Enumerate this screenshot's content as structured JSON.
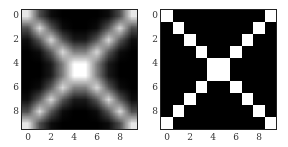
{
  "chart_data": [
    {
      "type": "heatmap",
      "title": "",
      "description": "Blurred (smoothed) X-shaped pattern on 10x10 grid",
      "xticks": [
        "0",
        "2",
        "4",
        "6",
        "8"
      ],
      "yticks": [
        "0",
        "2",
        "4",
        "6",
        "8"
      ],
      "xlim": [
        -0.5,
        9.5
      ],
      "ylim": [
        9.5,
        -0.5
      ],
      "colormap": "gray",
      "values": [
        [
          0.9,
          0.3,
          0.05,
          0,
          0,
          0,
          0,
          0.05,
          0.3,
          0.9
        ],
        [
          0.3,
          0.85,
          0.35,
          0.05,
          0,
          0,
          0.05,
          0.35,
          0.85,
          0.3
        ],
        [
          0.05,
          0.35,
          0.85,
          0.35,
          0.1,
          0.1,
          0.35,
          0.85,
          0.35,
          0.05
        ],
        [
          0,
          0.05,
          0.35,
          0.85,
          0.5,
          0.5,
          0.85,
          0.35,
          0.05,
          0
        ],
        [
          0,
          0,
          0.1,
          0.5,
          1,
          1,
          0.5,
          0.1,
          0,
          0
        ],
        [
          0,
          0,
          0.1,
          0.5,
          1,
          1,
          0.5,
          0.1,
          0,
          0
        ],
        [
          0,
          0.05,
          0.35,
          0.85,
          0.5,
          0.5,
          0.85,
          0.35,
          0.05,
          0
        ],
        [
          0.05,
          0.35,
          0.85,
          0.35,
          0.1,
          0.1,
          0.35,
          0.85,
          0.35,
          0.05
        ],
        [
          0.3,
          0.85,
          0.35,
          0.05,
          0,
          0,
          0.05,
          0.35,
          0.85,
          0.3
        ],
        [
          0.9,
          0.3,
          0.05,
          0,
          0,
          0,
          0,
          0.05,
          0.3,
          0.9
        ]
      ]
    },
    {
      "type": "heatmap",
      "title": "",
      "description": "Binary X-shaped pattern on 10x10 grid",
      "xticks": [
        "0",
        "2",
        "4",
        "6",
        "8"
      ],
      "yticks": [
        "0",
        "2",
        "4",
        "6",
        "8"
      ],
      "xlim": [
        -0.5,
        9.5
      ],
      "ylim": [
        9.5,
        -0.5
      ],
      "colormap": "gray",
      "values": [
        [
          1,
          0,
          0,
          0,
          0,
          0,
          0,
          0,
          0,
          1
        ],
        [
          0,
          1,
          0,
          0,
          0,
          0,
          0,
          0,
          1,
          0
        ],
        [
          0,
          0,
          1,
          0,
          0,
          0,
          0,
          1,
          0,
          0
        ],
        [
          0,
          0,
          0,
          1,
          0,
          0,
          1,
          0,
          0,
          0
        ],
        [
          0,
          0,
          0,
          0,
          1,
          1,
          0,
          0,
          0,
          0
        ],
        [
          0,
          0,
          0,
          0,
          1,
          1,
          0,
          0,
          0,
          0
        ],
        [
          0,
          0,
          0,
          1,
          0,
          0,
          1,
          0,
          0,
          0
        ],
        [
          0,
          0,
          1,
          0,
          0,
          0,
          0,
          1,
          0,
          0
        ],
        [
          0,
          1,
          0,
          0,
          0,
          0,
          0,
          0,
          1,
          0
        ],
        [
          1,
          0,
          0,
          0,
          0,
          0,
          0,
          0,
          0,
          1
        ]
      ]
    }
  ]
}
